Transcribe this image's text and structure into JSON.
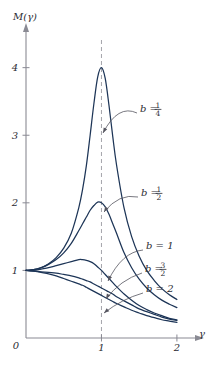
{
  "figure": {
    "axis_color": "#8a8a93",
    "curve_color": "#1d3557",
    "dash_color": "#9a9aa2",
    "leader_color": "#55555f",
    "text_color": "#2b2b33",
    "background": "#ffffff"
  },
  "axes": {
    "y_axis_label": "M(γ)",
    "x_axis_label": "γ",
    "origin_label": "0",
    "y_ticks": [
      {
        "value": 1,
        "label": "1"
      },
      {
        "value": 2,
        "label": "2"
      },
      {
        "value": 3,
        "label": "3"
      },
      {
        "value": 4,
        "label": "4"
      }
    ],
    "x_ticks": [
      {
        "value": 1,
        "label": "1"
      },
      {
        "value": 2,
        "label": "2"
      }
    ],
    "xlim": [
      0,
      2.2
    ],
    "ylim": [
      0,
      4.35
    ],
    "resonance_line": {
      "x": 1,
      "style": "dashed"
    }
  },
  "labels": [
    {
      "id": "b-quarter",
      "text": "b =",
      "num": "1",
      "den": "4",
      "x": 140,
      "y": 112
    },
    {
      "id": "b-half",
      "text": "b =",
      "num": "1",
      "den": "2",
      "x": 141,
      "y": 196
    },
    {
      "id": "b-one",
      "text": "b = 1",
      "num": "",
      "den": "",
      "x": 146,
      "y": 249
    },
    {
      "id": "b-threehalf",
      "text": "b =",
      "num": "3",
      "den": "2",
      "x": 145,
      "y": 272
    },
    {
      "id": "b-two",
      "text": "b = 2",
      "num": "",
      "den": "",
      "x": 146,
      "y": 292
    }
  ],
  "caption": "",
  "chart_data": {
    "type": "line",
    "title": "",
    "xlabel": "γ",
    "ylabel": "M(γ)",
    "xlim": [
      0,
      2.2
    ],
    "ylim": [
      0,
      4.35
    ],
    "grid": false,
    "legend": "inline-annotations",
    "annotations": [
      "b = 1/4",
      "b = 1/2",
      "b = 1",
      "b = 3/2",
      "b = 2"
    ],
    "x": [
      0,
      0.1,
      0.2,
      0.3,
      0.4,
      0.5,
      0.6,
      0.7,
      0.75,
      0.8,
      0.85,
      0.9,
      0.95,
      1.0,
      1.05,
      1.1,
      1.15,
      1.2,
      1.3,
      1.4,
      1.5,
      1.6,
      1.7,
      1.8,
      1.9,
      2.0
    ],
    "series": [
      {
        "name": "b = 1/4",
        "b": 0.25,
        "peak": {
          "x": 1.0,
          "y": 4.0
        },
        "values": [
          1.0,
          1.01,
          1.04,
          1.1,
          1.19,
          1.33,
          1.55,
          1.93,
          2.2,
          2.55,
          3.0,
          3.47,
          3.86,
          4.0,
          3.84,
          3.44,
          2.98,
          2.56,
          1.92,
          1.5,
          1.21,
          1.0,
          0.85,
          0.73,
          0.64,
          0.57
        ]
      },
      {
        "name": "b = 1/2",
        "b": 0.5,
        "peak": {
          "x": 0.97,
          "y": 2.02
        },
        "values": [
          1.0,
          1.01,
          1.04,
          1.09,
          1.16,
          1.26,
          1.4,
          1.59,
          1.69,
          1.79,
          1.89,
          1.96,
          2.01,
          2.0,
          1.94,
          1.83,
          1.69,
          1.55,
          1.26,
          1.04,
          0.87,
          0.74,
          0.64,
          0.56,
          0.5,
          0.45
        ]
      },
      {
        "name": "b = 1",
        "b": 1.0,
        "peak": {
          "x": 0.7,
          "y": 1.16
        },
        "values": [
          1.0,
          1.0,
          1.02,
          1.04,
          1.07,
          1.1,
          1.13,
          1.16,
          1.16,
          1.15,
          1.13,
          1.1,
          1.05,
          1.0,
          0.94,
          0.88,
          0.82,
          0.76,
          0.65,
          0.56,
          0.48,
          0.42,
          0.37,
          0.33,
          0.29,
          0.27
        ]
      },
      {
        "name": "b = 3/2",
        "b": 1.5,
        "peak": {
          "x": 0.0,
          "y": 1.0
        },
        "values": [
          1.0,
          0.99,
          0.98,
          0.97,
          0.96,
          0.94,
          0.92,
          0.89,
          0.87,
          0.85,
          0.83,
          0.8,
          0.77,
          0.74,
          0.71,
          0.68,
          0.65,
          0.61,
          0.55,
          0.49,
          0.43,
          0.39,
          0.35,
          0.31,
          0.28,
          0.26
        ]
      },
      {
        "name": "b = 2",
        "b": 2.0,
        "peak": {
          "x": 0.0,
          "y": 1.0
        },
        "values": [
          1.0,
          0.99,
          0.97,
          0.95,
          0.92,
          0.88,
          0.84,
          0.8,
          0.78,
          0.75,
          0.72,
          0.69,
          0.66,
          0.63,
          0.6,
          0.57,
          0.54,
          0.51,
          0.46,
          0.41,
          0.37,
          0.33,
          0.3,
          0.27,
          0.25,
          0.23
        ]
      }
    ]
  }
}
